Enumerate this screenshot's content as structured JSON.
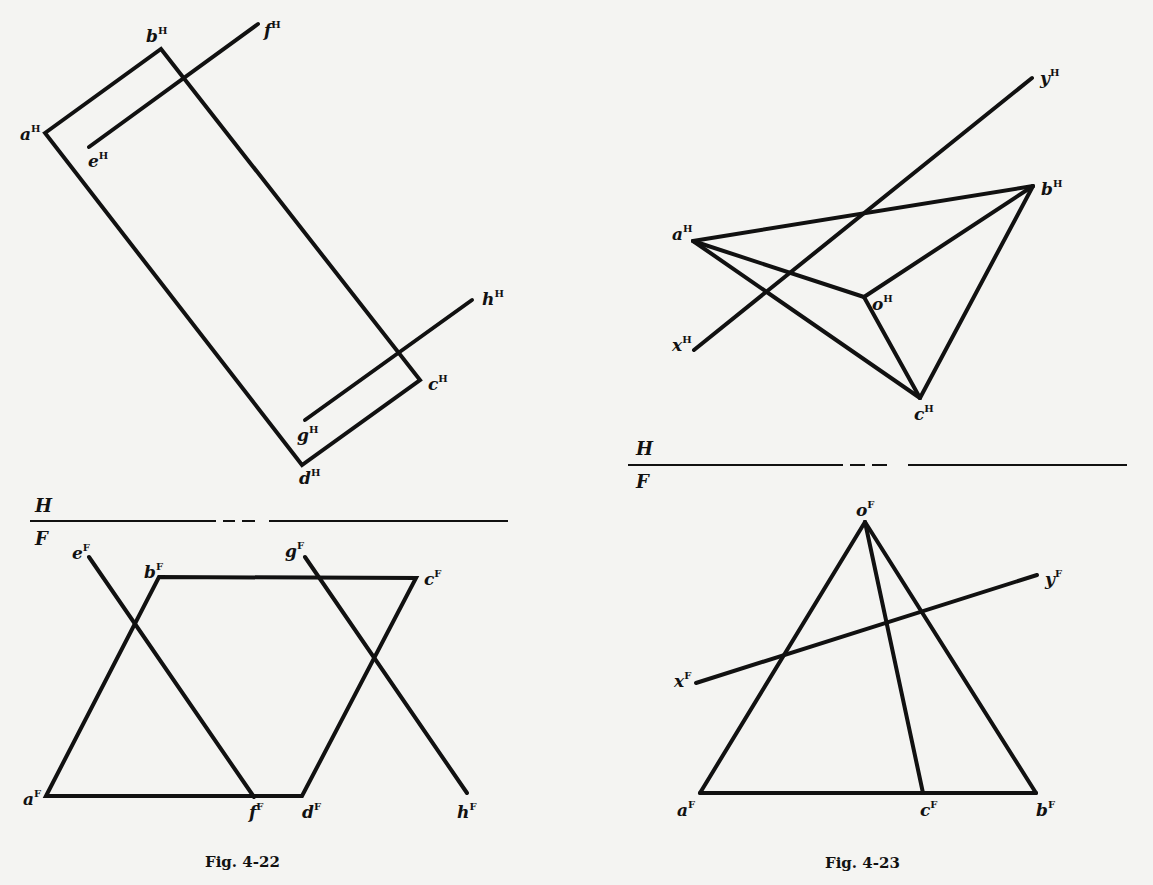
{
  "figures": [
    {
      "id": "fig-4-22",
      "caption": "Fig. 4-22",
      "divider": {
        "top_label": "H",
        "bottom_label": "F"
      },
      "horizontal_view": {
        "points": {
          "a": {
            "label": "a",
            "sup": "H"
          },
          "b": {
            "label": "b",
            "sup": "H"
          },
          "c": {
            "label": "c",
            "sup": "H"
          },
          "d": {
            "label": "d",
            "sup": "H"
          },
          "e": {
            "label": "e",
            "sup": "H"
          },
          "f": {
            "label": "f",
            "sup": "H"
          },
          "g": {
            "label": "g",
            "sup": "H"
          },
          "h": {
            "label": "h",
            "sup": "H"
          }
        }
      },
      "frontal_view": {
        "points": {
          "a": {
            "label": "a",
            "sup": "F"
          },
          "b": {
            "label": "b",
            "sup": "F"
          },
          "c": {
            "label": "c",
            "sup": "F"
          },
          "d": {
            "label": "d",
            "sup": "F"
          },
          "e": {
            "label": "e",
            "sup": "F"
          },
          "f": {
            "label": "f",
            "sup": "F"
          },
          "g": {
            "label": "g",
            "sup": "F"
          },
          "h": {
            "label": "h",
            "sup": "F"
          }
        }
      }
    },
    {
      "id": "fig-4-23",
      "caption": "Fig. 4-23",
      "divider": {
        "top_label": "H",
        "bottom_label": "F"
      },
      "horizontal_view": {
        "points": {
          "a": {
            "label": "a",
            "sup": "H"
          },
          "b": {
            "label": "b",
            "sup": "H"
          },
          "c": {
            "label": "c",
            "sup": "H"
          },
          "o": {
            "label": "o",
            "sup": "H"
          },
          "x": {
            "label": "x",
            "sup": "H"
          },
          "y": {
            "label": "y",
            "sup": "H"
          }
        }
      },
      "frontal_view": {
        "points": {
          "a": {
            "label": "a",
            "sup": "F"
          },
          "b": {
            "label": "b",
            "sup": "F"
          },
          "c": {
            "label": "c",
            "sup": "F"
          },
          "o": {
            "label": "o",
            "sup": "F"
          },
          "x": {
            "label": "x",
            "sup": "F"
          },
          "y": {
            "label": "y",
            "sup": "F"
          }
        }
      }
    }
  ]
}
